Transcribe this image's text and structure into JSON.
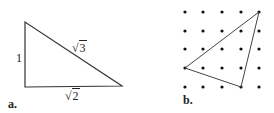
{
  "figure_a": {
    "label": "a.",
    "side_vertical": "1",
    "side_horizontal_radicand": "2",
    "hypotenuse_radicand": "3",
    "radical_symbol": "√"
  },
  "figure_b": {
    "label": "b.",
    "grid": {
      "rows": 5,
      "cols": 5
    },
    "triangle_vertices_grid": [
      [
        4,
        0
      ],
      [
        0,
        3
      ],
      [
        3,
        4
      ]
    ]
  },
  "colors": {
    "line": "#333333",
    "dot": "#111111",
    "background": "#ffffff"
  }
}
